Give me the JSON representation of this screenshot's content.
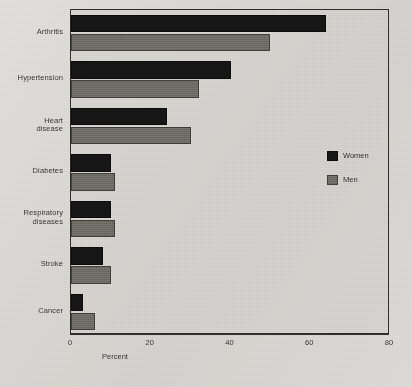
{
  "chart_data": {
    "type": "bar",
    "orientation": "horizontal",
    "title": "",
    "xlabel": "Percent",
    "ylabel": "",
    "xlim": [
      0,
      80
    ],
    "xticks": [
      0,
      20,
      40,
      60,
      80
    ],
    "xtick_labels": [
      "0",
      "20",
      "40",
      "60",
      "80"
    ],
    "grid": false,
    "legend_position": "right-middle",
    "categories": [
      "Arthritis",
      "Hypertension",
      "Heart disease",
      "Diabetes",
      "Respiratory diseases",
      "Stroke",
      "Cancer"
    ],
    "series": [
      {
        "name": "Women",
        "color": "#141414",
        "values": [
          64,
          40,
          24,
          10,
          10,
          8,
          3
        ]
      },
      {
        "name": "Men",
        "color": "#67655f",
        "values": [
          50,
          32,
          30,
          11,
          11,
          10,
          6
        ]
      }
    ]
  },
  "category_label_lines": [
    [
      "Arthritis"
    ],
    [
      "Hypertension"
    ],
    [
      "Heart",
      "disease"
    ],
    [
      "Diabetes"
    ],
    [
      "Respiratory",
      "diseases"
    ],
    [
      "Stroke"
    ],
    [
      "Cancer"
    ]
  ],
  "legend": {
    "items": [
      {
        "label": "Women",
        "color": "#141414"
      },
      {
        "label": "Men",
        "color": "#67655f"
      }
    ]
  },
  "axis": {
    "x_title": "Percent",
    "tick_labels": [
      "0",
      "20",
      "40",
      "60",
      "80"
    ]
  },
  "colors": {
    "background": "#d4d2cd",
    "frame": "#2b2b2b",
    "women": "#141414",
    "men": "#67655f",
    "text": "#2a2a2a"
  }
}
